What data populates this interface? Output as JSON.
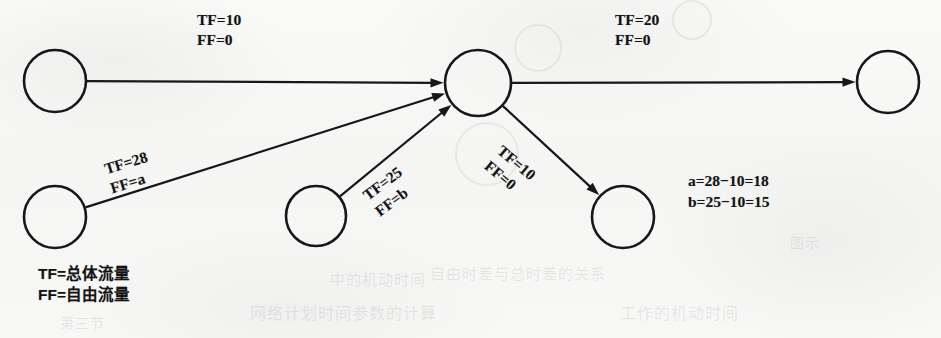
{
  "figure": {
    "type": "network-flow-diagram",
    "background_color": "#f7f7f6",
    "ink_color": "#17171a",
    "nodes": [
      {
        "id": "n1",
        "name": "source-top-left",
        "cx": 55,
        "cy": 81,
        "r": 31
      },
      {
        "id": "n2",
        "name": "source-bottom-left",
        "cx": 55,
        "cy": 217,
        "r": 31
      },
      {
        "id": "n3",
        "name": "source-bottom-mid",
        "cx": 316,
        "cy": 216,
        "r": 30
      },
      {
        "id": "n4",
        "name": "hub-center",
        "cx": 478,
        "cy": 83,
        "r": 33
      },
      {
        "id": "n5",
        "name": "sink-bottom-right",
        "cx": 623,
        "cy": 217,
        "r": 31
      },
      {
        "id": "n6",
        "name": "sink-far-right",
        "cx": 888,
        "cy": 82,
        "r": 31
      }
    ],
    "edges": [
      {
        "id": "e1",
        "name": "edge-top-left-to-hub",
        "from": "n1",
        "to": "n4",
        "tf_label": "TF=10",
        "ff_label": "FF=0",
        "label_x": 197,
        "label_y": 10,
        "label_rotation": 0
      },
      {
        "id": "e2",
        "name": "edge-hub-to-far-right",
        "from": "n4",
        "to": "n6",
        "tf_label": "TF=20",
        "ff_label": "FF=0",
        "label_x": 615,
        "label_y": 10,
        "label_rotation": 0
      },
      {
        "id": "e3",
        "name": "edge-bottom-left-to-hub",
        "from": "n2",
        "to": "n4",
        "tf_label": "TF=28",
        "ff_label": "FF=a",
        "label_x": 102,
        "label_y": 160,
        "label_rotation": -17
      },
      {
        "id": "e4",
        "name": "edge-bottom-mid-to-hub",
        "from": "n3",
        "to": "n4",
        "tf_label": "TF=25",
        "ff_label": "FF=b",
        "label_x": 359,
        "label_y": 189,
        "label_rotation": -37
      },
      {
        "id": "e5",
        "name": "edge-hub-to-bottom-right",
        "from": "n4",
        "to": "n5",
        "tf_label": "TF=10",
        "ff_label": "FF=0",
        "label_x": 506,
        "label_y": 141,
        "label_rotation": 40
      }
    ]
  },
  "legend": {
    "name": "notation-legend",
    "line1": "TF=总体流量",
    "line2": "FF=自由流量",
    "x": 38,
    "y": 263
  },
  "equations": {
    "name": "free-float-computations",
    "line1": "a=28−10=18",
    "line2": "b=25−10=15",
    "x": 688,
    "y": 170
  },
  "scan_artifacts": {
    "ghost_texts": [
      {
        "text": "中的机动时间",
        "x": 330,
        "y": 268,
        "size": 15
      },
      {
        "text": "自由时差与总时差的关系",
        "x": 430,
        "y": 262,
        "size": 15
      },
      {
        "text": "网络计划时间参数的计算",
        "x": 250,
        "y": 300,
        "size": 16
      },
      {
        "text": "工作的机动时间",
        "x": 620,
        "y": 300,
        "size": 16
      },
      {
        "text": "第三节",
        "x": 60,
        "y": 312,
        "size": 14
      },
      {
        "text": "图示",
        "x": 790,
        "y": 232,
        "size": 14
      }
    ],
    "ghost_circles": [
      {
        "cx": 485,
        "cy": 152,
        "r": 30
      },
      {
        "cx": 536,
        "cy": 46,
        "r": 22
      },
      {
        "cx": 690,
        "cy": 18,
        "r": 18
      }
    ]
  }
}
